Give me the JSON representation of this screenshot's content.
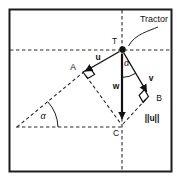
{
  "figure": {
    "annotation": {
      "tractor": "Tractor"
    },
    "points": {
      "T": "T",
      "A": "A",
      "B": "B",
      "C": "C"
    },
    "vectors": {
      "u": "u",
      "v": "v",
      "w": "w"
    },
    "angles": {
      "alpha_top": "α",
      "alpha_bottom": "α"
    },
    "measure": {
      "u_magnitude": "||u||"
    },
    "colors": {
      "ink": "#1c1c1c",
      "paper": "#ffffff"
    }
  }
}
